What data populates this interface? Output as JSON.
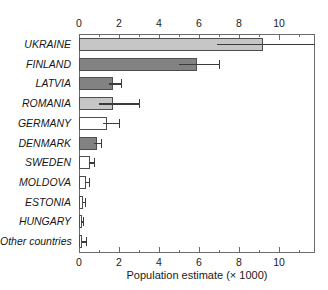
{
  "chart_data": {
    "type": "bar",
    "orientation": "horizontal",
    "title": "",
    "xlabel": "Population estimate (× 1000)",
    "ylabel": "",
    "xlim": [
      0,
      11.8
    ],
    "xticks": [
      0,
      2,
      4,
      6,
      8,
      10
    ],
    "xtick_labels": [
      "0",
      "2",
      "4",
      "6",
      "8",
      "10"
    ],
    "minor_tick_step": 1,
    "grid": false,
    "legend": "none",
    "axis_top": true,
    "axis_bottom": true,
    "categories": [
      "UKRAINE",
      "FINLAND",
      "LATVIA",
      "ROMANIA",
      "GERMANY",
      "DENMARK",
      "SWEDEN",
      "MOLDOVA",
      "ESTONIA",
      "HUNGARY",
      "Other countries"
    ],
    "values": [
      9.2,
      5.9,
      1.7,
      1.7,
      1.4,
      0.9,
      0.55,
      0.35,
      0.2,
      0.12,
      0.15
    ],
    "error_low": [
      6.9,
      5.0,
      1.5,
      1.0,
      1.2,
      0.75,
      0.5,
      0.3,
      0.18,
      0.1,
      0.13
    ],
    "error_high": [
      11.8,
      7.0,
      2.1,
      3.0,
      2.0,
      1.1,
      0.75,
      0.5,
      0.3,
      0.2,
      0.35
    ],
    "bar_colors": [
      "#c6c6c6",
      "#828282",
      "#828282",
      "#c6c6c6",
      "#ffffff",
      "#828282",
      "#ffffff",
      "#ffffff",
      "#ffffff",
      "#ffffff",
      "#ffffff"
    ],
    "bar_edge_color": "#4d4d4d",
    "error_color": "#3b3b3b",
    "frame_color": "#6b6b6b",
    "background": "#ffffff"
  }
}
